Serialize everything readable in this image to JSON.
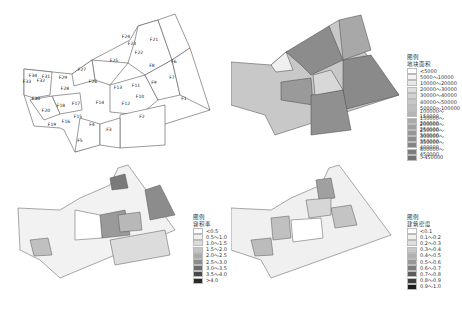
{
  "figure": {
    "panels": [
      {
        "id": "a",
        "title": "",
        "legend": null
      },
      {
        "id": "b",
        "legend": {
          "heading": "图例",
          "subheading": "地块面积",
          "items": [
            {
              "label": "<5000",
              "color": "#ffffff"
            },
            {
              "label": "5000～10000",
              "color": "#f4f4f4"
            },
            {
              "label": "10000～20000",
              "color": "#e8e8e8"
            },
            {
              "label": "20000～30000",
              "color": "#dddddd"
            },
            {
              "label": "30000～40000",
              "color": "#d2d2d2"
            },
            {
              "label": "40000～50000",
              "color": "#c8c8c8"
            },
            {
              "label": "50000～100000",
              "color": "#bebebe"
            },
            {
              "label": "100000～150000",
              "color": "#b4b4b4"
            },
            {
              "label": "150000～200000",
              "color": "#aaaaaa"
            },
            {
              "label": "200000～250000",
              "color": "#a0a0a0"
            },
            {
              "label": "250000～300000",
              "color": "#979797"
            },
            {
              "label": "300000～350000",
              "color": "#8e8e8e"
            },
            {
              "label": "350000～400000",
              "color": "#858585"
            },
            {
              "label": "400000～450000",
              "color": "#7c7c7c"
            },
            {
              "label": ">450000",
              "color": "#737373"
            }
          ]
        }
      },
      {
        "id": "c",
        "legend": {
          "heading": "图例",
          "subheading": "容积率",
          "items": [
            {
              "label": "<0.5",
              "color": "#ffffff"
            },
            {
              "label": "0.5～1.0",
              "color": "#f0f0f0"
            },
            {
              "label": "1.0～1.5",
              "color": "#dcdcdc"
            },
            {
              "label": "1.5～2.0",
              "color": "#c4c4c4"
            },
            {
              "label": "2.0～2.5",
              "color": "#aaaaaa"
            },
            {
              "label": "2.5～3.0",
              "color": "#8c8c8c"
            },
            {
              "label": "3.0～3.5",
              "color": "#6c6c6c"
            },
            {
              "label": "3.5～4.0",
              "color": "#4a4a4a"
            },
            {
              "label": ">4.0",
              "color": "#2a2a2a"
            }
          ]
        }
      },
      {
        "id": "d",
        "legend": {
          "heading": "图例",
          "subheading": "建筑密度",
          "items": [
            {
              "label": "<0.1",
              "color": "#ffffff"
            },
            {
              "label": "0.1～0.2",
              "color": "#f0f0f0"
            },
            {
              "label": "0.2～0.3",
              "color": "#dedede"
            },
            {
              "label": "0.3～0.4",
              "color": "#c8c8c8"
            },
            {
              "label": "0.4～0.5",
              "color": "#b0b0b0"
            },
            {
              "label": "0.5～0.6",
              "color": "#989898"
            },
            {
              "label": "0.6～0.7",
              "color": "#7c7c7c"
            },
            {
              "label": "0.7～0.8",
              "color": "#5c5c5c"
            },
            {
              "label": "0.8～0.9",
              "color": "#3c3c3c"
            },
            {
              "label": "0.9～1.0",
              "color": "#1c1c1c"
            }
          ]
        }
      }
    ],
    "parcel_labels": [
      "F1",
      "F2",
      "F3",
      "F4",
      "F5",
      "F6",
      "F7",
      "F8",
      "F9",
      "F10",
      "F11",
      "F12",
      "F13",
      "F14",
      "F15",
      "F16",
      "F17",
      "F18",
      "F19",
      "F20",
      "F21",
      "F22",
      "F23",
      "F24",
      "F25",
      "F26",
      "F27",
      "F28",
      "F29",
      "F30",
      "F31",
      "F32",
      "F33",
      "F34"
    ]
  }
}
